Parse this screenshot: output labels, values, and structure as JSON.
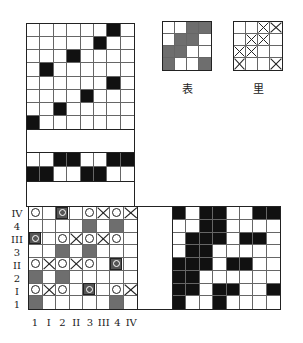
{
  "figure": {
    "threading_grid": {
      "cols": 8,
      "rows": [
        "......b.",
        ".....b..",
        "...b....",
        ".b......",
        "......b.",
        "....b...",
        "..b.....",
        "b......."
      ],
      "row_fix": [
        "0000000b",
        "00000b00",
        "000b0000",
        "0b000000",
        "000000b0",
        "0000b000",
        "00b00000",
        "b0000000"
      ]
    },
    "tieup_band": {
      "rows": [
        "..bb..bb",
        "bb..bb.."
      ]
    },
    "face_swatch": {
      "label": "表",
      "rows": [
        "..gg",
        ".gg.",
        "gg..",
        "g..g"
      ]
    },
    "back_swatch": {
      "label": "里",
      "rows": [
        "..xx",
        ".xx.",
        "xx..",
        "x..x"
      ]
    },
    "treadling_grid": {
      "row_labels": [
        "IV",
        "4",
        "III",
        "3",
        "II",
        "2",
        "I",
        "1"
      ],
      "col_labels": [
        "1",
        "I",
        "2",
        "II",
        "3",
        "III",
        "4",
        "IV"
      ],
      "legend": {
        "o": "circle",
        "x": "cross",
        "s": "boxed-circle",
        "g": "gray-fill",
        ".": "empty"
      },
      "rows": [
        "o.s.oxox",
        "....g.g.",
        "s.oxoxo.",
        "..g.g...",
        "oxoxo.s.",
        "g.g.....",
        "oxo.s.ox",
        "g.....g."
      ]
    },
    "drawdown_grid": {
      "rows": [
        "b.bb..bb",
        "..bb....",
        ".bbb.bb.",
        ".bb.....",
        "bbb.bb..",
        "bb......",
        "bb.bb..b",
        "b..b...."
      ]
    },
    "colors": {
      "black": "#111111",
      "gray": "#6e6e6e",
      "line": "#222222"
    }
  }
}
